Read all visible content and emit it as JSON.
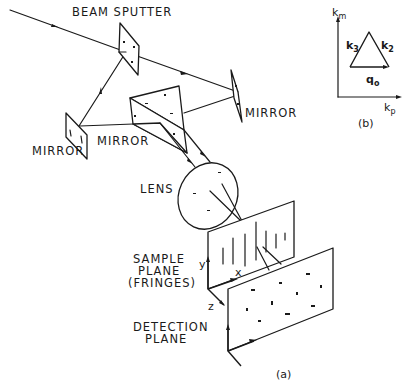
{
  "figure": {
    "panel_a": {
      "caption": "(a)",
      "labels": {
        "beam_splitter": "BEAM SPUTTER",
        "mirror_right": "MIRROR",
        "mirror_left": "MIRROR",
        "mirror_prism": "MIRROR",
        "lens": "LENS",
        "sample_plane_line1": "SAMPLE",
        "sample_plane_line2": "PLANE",
        "sample_plane_line3": "(FRINGES)",
        "detection_plane_line1": "DETECTION",
        "detection_plane_line2": "PLANE",
        "axis_x": "x",
        "axis_y": "y",
        "axis_z": "z"
      }
    },
    "panel_b": {
      "caption": "(b)",
      "axis_vertical": "k",
      "axis_vertical_sub": "m",
      "axis_horizontal": "k",
      "axis_horizontal_sub": "p",
      "vector_left": "k",
      "vector_left_sub": "3",
      "vector_right": "k",
      "vector_right_sub": "2",
      "vector_base": "q",
      "vector_base_sub": "o"
    }
  }
}
